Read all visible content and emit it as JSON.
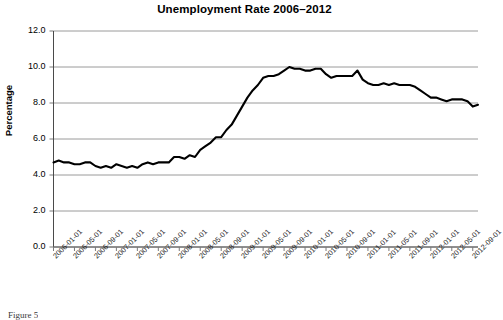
{
  "figure": {
    "caption": "Figure 5"
  },
  "chart_data": {
    "type": "line",
    "title": "Unemployment Rate 2006–2012",
    "xlabel": "",
    "ylabel": "Percentage",
    "ylim": [
      0.0,
      12.0
    ],
    "yticks": [
      "0.0",
      "2.0",
      "4.0",
      "6.0",
      "8.0",
      "10.0",
      "12.0"
    ],
    "ytick_values": [
      0.0,
      2.0,
      4.0,
      6.0,
      8.0,
      10.0,
      12.0
    ],
    "grid": "horizontal",
    "legend": "none",
    "line_color": "#000000",
    "grid_color": "#9a9a9a",
    "axis_color": "#7a7a7a",
    "xtick_labels": [
      "2006-01-01",
      "2006-05-01",
      "2006-09-01",
      "2007-01-01",
      "2007-05-01",
      "2007-09-01",
      "2008-01-01",
      "2008-05-01",
      "2008-09-01",
      "2009-01-01",
      "2009-05-01",
      "2009-09-01",
      "2010-01-01",
      "2010-05-01",
      "2010-09-01",
      "2011-01-01",
      "2011-05-01",
      "2011-09-01",
      "2012-01-01",
      "2012-05-01",
      "2012-09-01"
    ],
    "x": [
      "2006-01",
      "2006-02",
      "2006-03",
      "2006-04",
      "2006-05",
      "2006-06",
      "2006-07",
      "2006-08",
      "2006-09",
      "2006-10",
      "2006-11",
      "2006-12",
      "2007-01",
      "2007-02",
      "2007-03",
      "2007-04",
      "2007-05",
      "2007-06",
      "2007-07",
      "2007-08",
      "2007-09",
      "2007-10",
      "2007-11",
      "2007-12",
      "2008-01",
      "2008-02",
      "2008-03",
      "2008-04",
      "2008-05",
      "2008-06",
      "2008-07",
      "2008-08",
      "2008-09",
      "2008-10",
      "2008-11",
      "2008-12",
      "2009-01",
      "2009-02",
      "2009-03",
      "2009-04",
      "2009-05",
      "2009-06",
      "2009-07",
      "2009-08",
      "2009-09",
      "2009-10",
      "2009-11",
      "2009-12",
      "2010-01",
      "2010-02",
      "2010-03",
      "2010-04",
      "2010-05",
      "2010-06",
      "2010-07",
      "2010-08",
      "2010-09",
      "2010-10",
      "2010-11",
      "2010-12",
      "2011-01",
      "2011-02",
      "2011-03",
      "2011-04",
      "2011-05",
      "2011-06",
      "2011-07",
      "2011-08",
      "2011-09",
      "2011-10",
      "2011-11",
      "2011-12",
      "2012-01",
      "2012-02",
      "2012-03",
      "2012-04",
      "2012-05",
      "2012-06",
      "2012-07",
      "2012-08",
      "2012-09",
      "2012-10"
    ],
    "values": [
      4.7,
      4.8,
      4.7,
      4.7,
      4.6,
      4.6,
      4.7,
      4.7,
      4.5,
      4.4,
      4.5,
      4.4,
      4.6,
      4.5,
      4.4,
      4.5,
      4.4,
      4.6,
      4.7,
      4.6,
      4.7,
      4.7,
      4.7,
      5.0,
      5.0,
      4.9,
      5.1,
      5.0,
      5.4,
      5.6,
      5.8,
      6.1,
      6.1,
      6.5,
      6.8,
      7.3,
      7.8,
      8.3,
      8.7,
      9.0,
      9.4,
      9.5,
      9.5,
      9.6,
      9.8,
      10.0,
      9.9,
      9.9,
      9.8,
      9.8,
      9.9,
      9.9,
      9.6,
      9.4,
      9.5,
      9.5,
      9.5,
      9.5,
      9.8,
      9.3,
      9.1,
      9.0,
      9.0,
      9.1,
      9.0,
      9.1,
      9.0,
      9.0,
      9.0,
      8.9,
      8.7,
      8.5,
      8.3,
      8.3,
      8.2,
      8.1,
      8.2,
      8.2,
      8.2,
      8.1,
      7.8,
      7.9
    ]
  }
}
